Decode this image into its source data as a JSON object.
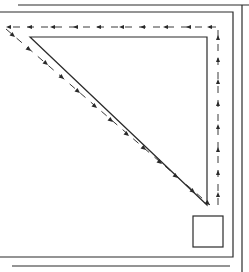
{
  "diagram": {
    "type": "line-drawing",
    "colors": {
      "stroke": "#2a2a2a",
      "background": "#ffffff"
    },
    "elements": {
      "outer_frame": {
        "top_y": 5,
        "right_x": 242
      },
      "inner_frame": {
        "top_y": 12,
        "right_x": 233,
        "bottom_y": 257
      },
      "bottom_outer_line_y": 266,
      "triangle": {
        "points": [
          [
            30,
            37
          ],
          [
            207,
            37
          ],
          [
            207,
            205
          ]
        ]
      },
      "small_square": {
        "x": 193,
        "y": 216,
        "w": 30,
        "h": 31
      },
      "flow_path": {
        "segments": [
          {
            "name": "top",
            "direction": "left",
            "from": [
              218,
              27
            ],
            "to": [
              5,
              27
            ]
          },
          {
            "name": "diagonal",
            "direction": "down-right",
            "from": [
              5,
              27
            ],
            "to": [
              210,
              205
            ]
          },
          {
            "name": "right",
            "direction": "up",
            "from": [
              218,
              205
            ],
            "to": [
              218,
              27
            ]
          }
        ]
      }
    }
  }
}
